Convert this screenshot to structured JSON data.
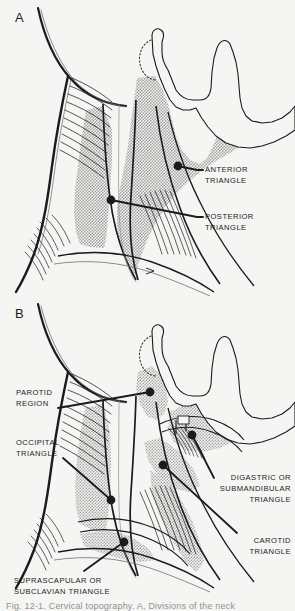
{
  "figure": {
    "background_color": "#f5f5f3",
    "ink_color": "#1b1b1b",
    "shade_color": "#c9c9c7",
    "panels": [
      {
        "letter": "A",
        "name": "panel-a",
        "labels": [
          {
            "id": "anterior-triangle",
            "line1": "ANTERIOR",
            "line2": "TRIANGLE",
            "text_x": 205,
            "text_y": 170,
            "dot_x": 178,
            "dot_y": 166,
            "elbow_x": 197,
            "elbow_y": 173
          },
          {
            "id": "posterior-triangle",
            "line1": "POSTERIOR",
            "line2": "TRIANGLE",
            "text_x": 205,
            "text_y": 214,
            "dot_x": 111,
            "dot_y": 200,
            "elbow_x": 197,
            "elbow_y": 217
          }
        ]
      },
      {
        "letter": "B",
        "name": "panel-b",
        "labels": [
          {
            "id": "parotid-region",
            "line1": "PAROTID",
            "line2": "REGION",
            "text_x": 16,
            "text_y": 393,
            "dot_x": 150,
            "dot_y": 392,
            "elbow_x": 58,
            "elbow_y": 408
          },
          {
            "id": "occipital-triangle",
            "line1": "OCCIPITAL",
            "line2": "TRIANGLE",
            "text_x": 16,
            "text_y": 443,
            "dot_x": 111,
            "dot_y": 500,
            "elbow_x": 63,
            "elbow_y": 460
          },
          {
            "id": "digastric-submandibular-triangle",
            "line1": "DIGASTRIC OR",
            "line2": "SUBMANDIBULAR",
            "line3": "TRIANGLE",
            "text_x": 216,
            "text_y": 478,
            "dot_x": 192,
            "dot_y": 435,
            "elbow_x": 214,
            "elbow_y": 481
          },
          {
            "id": "carotid-triangle",
            "line1": "CAROTID",
            "line2": "TRIANGLE",
            "text_x": 240,
            "text_y": 538,
            "dot_x": 163,
            "dot_y": 465,
            "elbow_x": 237,
            "elbow_y": 533
          },
          {
            "id": "suprascapular-subclavian-triangle",
            "line1": "SUPRASCAPULAR OR",
            "line2": "SUBCLAVIAN TRIANGLE",
            "text_x": 14,
            "text_y": 581,
            "dot_x": 124,
            "dot_y": 542,
            "elbow_x": 84,
            "elbow_y": 571
          }
        ]
      }
    ],
    "caption": "Fig. 12-1. Cervical topography. A, Divisions of the neck"
  }
}
